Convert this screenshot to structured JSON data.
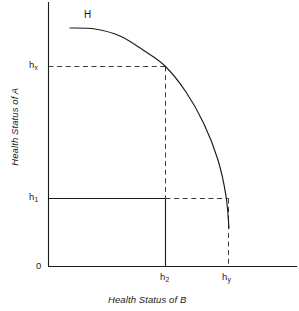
{
  "figure": {
    "type": "economics-diagram",
    "background_color": "#ffffff",
    "line_color": "#1a1a1a"
  },
  "chart_data": {
    "type": "line",
    "title": "",
    "subtitle": "",
    "xlabel": "Health Status of B",
    "ylabel": "Health Status of A",
    "grid": false,
    "legend": false,
    "origin_label": "0",
    "curve_label": "H",
    "axis": {
      "x_axis_y_px": 266,
      "y_axis_x_px": 48,
      "x_axis_end_px": 297,
      "y_axis_top_px": 2
    },
    "x_ticks": [
      {
        "label": "h",
        "sub": "2",
        "x_px": 165,
        "style": "solid"
      },
      {
        "label": "h",
        "sub": "y",
        "x_px": 228,
        "style": "dashed"
      }
    ],
    "y_ticks": [
      {
        "label": "h",
        "sub": "x",
        "y_px": 66,
        "style": "dashed"
      },
      {
        "label": "h",
        "sub": "1",
        "y_px": 198,
        "style": "solid"
      },
      {
        "label": "0",
        "sub": "",
        "y_px": 266,
        "style": "none"
      }
    ],
    "curve": {
      "name": "H",
      "style": "solid",
      "points": [
        {
          "x_px": 70,
          "y_px": 28
        },
        {
          "x_px": 95,
          "y_px": 29
        },
        {
          "x_px": 120,
          "y_px": 36
        },
        {
          "x_px": 143,
          "y_px": 50
        },
        {
          "x_px": 165,
          "y_px": 66
        },
        {
          "x_px": 186,
          "y_px": 92
        },
        {
          "x_px": 204,
          "y_px": 124
        },
        {
          "x_px": 218,
          "y_px": 160
        },
        {
          "x_px": 226,
          "y_px": 196
        },
        {
          "x_px": 229,
          "y_px": 228
        }
      ]
    },
    "reference_lines": [
      {
        "name": "hx-horizontal",
        "from": [
          48,
          66
        ],
        "to": [
          165,
          66
        ],
        "style": "dashed"
      },
      {
        "name": "h2-vertical-upper",
        "from": [
          165,
          66
        ],
        "to": [
          165,
          198
        ],
        "style": "dashed"
      },
      {
        "name": "h2-vertical-lower",
        "from": [
          165,
          198
        ],
        "to": [
          165,
          266
        ],
        "style": "solid"
      },
      {
        "name": "h1-horizontal-solid",
        "from": [
          48,
          198
        ],
        "to": [
          165,
          198
        ],
        "style": "solid"
      },
      {
        "name": "h1-horizontal-dashed",
        "from": [
          165,
          198
        ],
        "to": [
          228,
          198
        ],
        "style": "dashed"
      },
      {
        "name": "hy-vertical",
        "from": [
          228,
          198
        ],
        "to": [
          228,
          266
        ],
        "style": "dashed"
      }
    ]
  },
  "labels": {
    "curve": "H",
    "origin": "0",
    "hx_base": "h",
    "hx_sub": "x",
    "h1_base": "h",
    "h1_sub": "1",
    "h2_base": "h",
    "h2_sub": "2",
    "hy_base": "h",
    "hy_sub": "y",
    "x_axis_title": "Health Status of B",
    "y_axis_title": "Health Status of A"
  }
}
